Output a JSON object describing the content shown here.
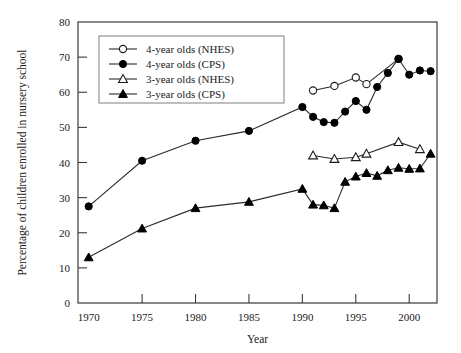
{
  "chart_data": {
    "type": "line",
    "title": "",
    "xlabel": "Year",
    "ylabel": "Percentage of children enrolled in nursery school",
    "xlim": [
      1969,
      2002.6
    ],
    "ylim": [
      0,
      80
    ],
    "xticks": [
      1970,
      1975,
      1980,
      1985,
      1990,
      1995,
      2000
    ],
    "yticks": [
      0,
      10,
      20,
      30,
      40,
      50,
      60,
      70,
      80
    ],
    "grid": false,
    "legend_position": "upper-left-inside",
    "series": [
      {
        "name": "4-year olds (NHES)",
        "marker": "open-circle",
        "x": [
          1991,
          1993,
          1995,
          1996,
          1999
        ],
        "values": [
          60.5,
          61.8,
          64.2,
          62.3,
          69.5
        ]
      },
      {
        "name": "4-year olds (CPS)",
        "marker": "solid-circle",
        "x": [
          1970,
          1975,
          1980,
          1985,
          1990,
          1991,
          1992,
          1993,
          1994,
          1995,
          1996,
          1997,
          1998,
          1999,
          2000,
          2001,
          2002
        ],
        "values": [
          27.5,
          40.5,
          46.2,
          49.0,
          55.8,
          53.0,
          51.5,
          51.3,
          54.5,
          57.5,
          55.0,
          61.5,
          65.5,
          69.5,
          65.0,
          66.2,
          66.0
        ]
      },
      {
        "name": "3-year olds (NHES)",
        "marker": "open-triangle",
        "x": [
          1991,
          1993,
          1995,
          1996,
          1999,
          2001
        ],
        "values": [
          42.0,
          41.0,
          41.5,
          42.5,
          45.8,
          43.8
        ]
      },
      {
        "name": "3-year olds (CPS)",
        "marker": "solid-triangle",
        "x": [
          1970,
          1975,
          1980,
          1985,
          1990,
          1991,
          1992,
          1993,
          1994,
          1995,
          1996,
          1997,
          1998,
          1999,
          2000,
          2001,
          2002
        ],
        "values": [
          13.0,
          21.2,
          27.0,
          28.8,
          32.5,
          28.0,
          27.8,
          27.0,
          34.5,
          36.0,
          37.0,
          36.2,
          37.8,
          38.5,
          38.2,
          38.3,
          42.5
        ]
      }
    ]
  },
  "legend": {
    "items": [
      {
        "label": "4-year olds (NHES)",
        "marker": "open-circle"
      },
      {
        "label": "4-year olds (CPS)",
        "marker": "solid-circle"
      },
      {
        "label": "3-year olds (NHES)",
        "marker": "open-triangle"
      },
      {
        "label": "3-year olds (CPS)",
        "marker": "solid-triangle"
      }
    ]
  }
}
